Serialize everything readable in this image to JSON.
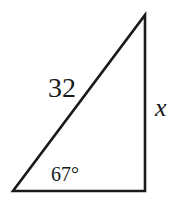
{
  "diagram": {
    "type": "right-triangle",
    "stroke_color": "#1a1a1a",
    "background": "#ffffff",
    "vertices": {
      "bottom_left": [
        13,
        191
      ],
      "bottom_right": [
        145,
        191
      ],
      "top": [
        145,
        15
      ]
    },
    "labels": {
      "hypotenuse": "32",
      "angle": "67°",
      "opposite_side": "x"
    }
  }
}
